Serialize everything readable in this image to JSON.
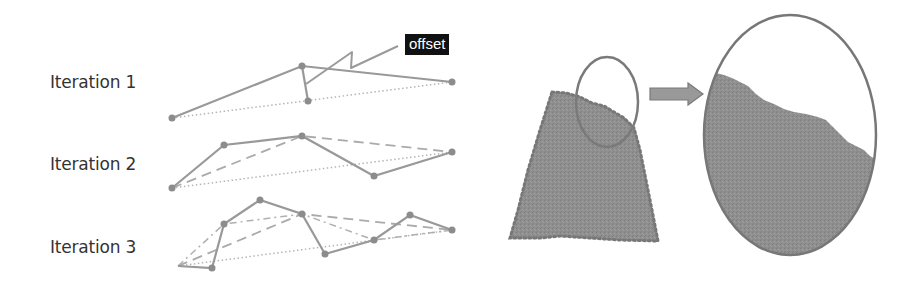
{
  "left_panel": {
    "iterations": [
      {
        "label": "Iteration 1"
      },
      {
        "label": "Iteration 2"
      },
      {
        "label": "Iteration 3"
      }
    ],
    "annotation": {
      "label": "offset"
    }
  },
  "colors": {
    "line": "#999999",
    "point": "#8c8c8c",
    "fill": "#8f8f8f",
    "outline": "#7a7a7a",
    "label_bg": "#111111",
    "label_text": "#ffffff"
  },
  "diagram": {
    "iteration1": {
      "points": [
        [
          172,
          118
        ],
        [
          302,
          66
        ],
        [
          452,
          82
        ]
      ],
      "offset_point": [
        308,
        101
      ],
      "baseline": [
        [
          172,
          118
        ],
        [
          452,
          82
        ]
      ]
    },
    "iteration2": {
      "points": [
        [
          172,
          188
        ],
        [
          224,
          145
        ],
        [
          302,
          136
        ],
        [
          374,
          176
        ],
        [
          452,
          152
        ]
      ]
    },
    "iteration3": {
      "points": [
        [
          178,
          266
        ],
        [
          212,
          268
        ],
        [
          224,
          224
        ],
        [
          260,
          200
        ],
        [
          302,
          214
        ],
        [
          325,
          254
        ],
        [
          374,
          240
        ],
        [
          410,
          215
        ],
        [
          452,
          230
        ]
      ]
    }
  }
}
